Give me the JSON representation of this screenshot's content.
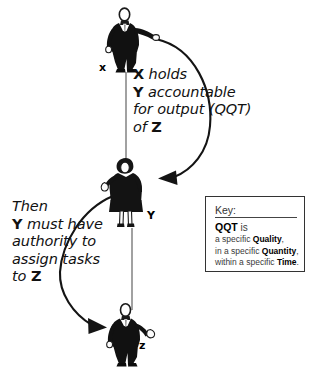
{
  "diagram": {
    "background_color": "#ffffff",
    "ink_color": "#000000",
    "entities": [
      {
        "id": "x",
        "label": "x",
        "role": "manager figure, man in dark suit, arm extended to the right"
      },
      {
        "id": "y",
        "label": "Y",
        "role": "middle figure, woman in dark dress with raised hand"
      },
      {
        "id": "z",
        "label": "z",
        "role": "subordinate figure, man in dark suit with open hand"
      }
    ],
    "statements": {
      "top": {
        "lines": [
          {
            "bold_lead": "X",
            "rest": " holds"
          },
          {
            "bold_lead": "Y",
            "rest": " accountable"
          },
          {
            "bold_lead": "",
            "rest": "for output (QQT)"
          },
          {
            "bold_lead": "",
            "rest": "of ",
            "bold_tail": "Z"
          }
        ],
        "plain_text": "X holds Y accountable for output (QQT) of Z"
      },
      "bottom": {
        "lines": [
          {
            "bold_lead": "",
            "rest": "Then"
          },
          {
            "bold_lead": "Y",
            "rest": " must have"
          },
          {
            "bold_lead": "",
            "rest": "authority to"
          },
          {
            "bold_lead": "",
            "rest": "assign tasks"
          },
          {
            "bold_lead": "",
            "rest": "to ",
            "bold_tail": "Z"
          }
        ],
        "plain_text": "Then Y must have authority to assign tasks to Z"
      }
    },
    "key": {
      "title": "Key:",
      "lead_term": "QQT",
      "lead_suffix": " is",
      "lines": [
        {
          "prefix": "a specific ",
          "term": "Quality",
          "suffix": ","
        },
        {
          "prefix": "in a specific ",
          "term": "Quantity",
          "suffix": ","
        },
        {
          "prefix": "within a specific ",
          "term": "Time",
          "suffix": "."
        }
      ]
    },
    "connectors": [
      {
        "id": "x-to-y-curve",
        "from": "x",
        "to": "y",
        "style": "curved arrow, clockwise to the right",
        "arrowhead": "filled triangle"
      },
      {
        "id": "y-to-z-curve",
        "from": "y",
        "to": "z",
        "style": "curved arrow, counter-clockwise to the left",
        "arrowhead": "filled triangle"
      },
      {
        "id": "x-to-y-line",
        "from": "x",
        "to": "y",
        "style": "thin straight vertical line",
        "arrowhead": "none"
      },
      {
        "id": "y-to-z-line",
        "from": "y",
        "to": "z",
        "style": "thin straight vertical line",
        "arrowhead": "none"
      }
    ]
  }
}
